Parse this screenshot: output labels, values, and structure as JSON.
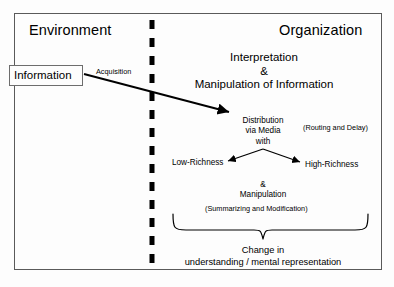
{
  "diagram": {
    "title_left": "Environment",
    "title_right": "Organization",
    "information_box": "Information",
    "acquisition_label": "Acquisition",
    "interpretation_line1": "Interpretation",
    "interpretation_line2": "&",
    "interpretation_line3": "Manipulation of Information",
    "distribution_line1": "Distribution",
    "distribution_line2": "via Media",
    "distribution_line3": "with",
    "routing_note": "(Routing and Delay)",
    "low_richness": "Low-Richness",
    "high_richness": "High-Richness",
    "manipulation_line1": "&",
    "manipulation_line2": "Manipulation",
    "summarizing_note": "(Summarizing and Modification)",
    "outcome_line1": "Change in",
    "outcome_line2": "understanding / mental representation",
    "divider": "vertical-dashed-boundary",
    "colors": {
      "line": "#000000",
      "frame": "#5a5a5a",
      "box_border": "#6d6d6d",
      "background": "#fdfdfd"
    }
  }
}
